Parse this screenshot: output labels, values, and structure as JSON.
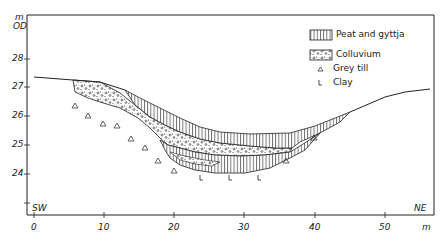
{
  "figure": {
    "y_axis": {
      "unit_line1": "m",
      "unit_line2": "OD",
      "ticks": [
        {
          "label": "28",
          "value": 28
        },
        {
          "label": "27",
          "value": 27
        },
        {
          "label": "26",
          "value": 26
        },
        {
          "label": "25",
          "value": 25
        },
        {
          "label": "24",
          "value": 24
        },
        {
          "label": "",
          "value": 23
        }
      ]
    },
    "x_axis": {
      "unit": "m",
      "ticks": [
        {
          "label": "0",
          "value": 0
        },
        {
          "label": "10",
          "value": 10
        },
        {
          "label": "20",
          "value": 20
        },
        {
          "label": "30",
          "value": 30
        },
        {
          "label": "40",
          "value": 40
        },
        {
          "label": "50",
          "value": 50
        }
      ]
    },
    "orientation": {
      "left": "SW",
      "right": "NE"
    },
    "legend": [
      {
        "label": "Peat and gyttja",
        "symbol": "vertical-hatch"
      },
      {
        "label": "Colluvium",
        "symbol": "stipple"
      },
      {
        "label": "Grey till",
        "symbol": "triangle"
      },
      {
        "label": "Clay",
        "symbol": "L"
      }
    ],
    "colors": {
      "ink": "#222222",
      "background": "#ffffff"
    }
  }
}
